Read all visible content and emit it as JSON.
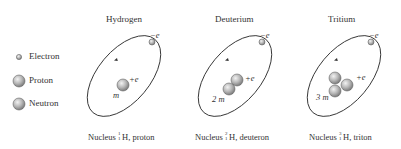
{
  "legend": {
    "items": [
      {
        "label": "Electron",
        "icon": "electron-icon"
      },
      {
        "label": "Proton",
        "icon": "proton-icon"
      },
      {
        "label": "Neutron",
        "icon": "neutron-icon"
      }
    ]
  },
  "atoms": [
    {
      "title": "Hydrogen",
      "electron_charge": "−e",
      "nucleus_charge": "+e",
      "mass_label": "m",
      "caption_prefix": "Nucleus",
      "mass_number": "1",
      "atomic_number": "1",
      "symbol": "H",
      "caption_suffix": ", proton"
    },
    {
      "title": "Deuterium",
      "electron_charge": "−e",
      "nucleus_charge": "+e",
      "mass_label": "2 m",
      "caption_prefix": "Nucleus",
      "mass_number": "2",
      "atomic_number": "1",
      "symbol": "H",
      "caption_suffix": ", deuteron"
    },
    {
      "title": "Tritium",
      "electron_charge": "−e",
      "nucleus_charge": "+e",
      "mass_label": "3 m",
      "caption_prefix": "Nucleus",
      "mass_number": "3",
      "atomic_number": "1",
      "symbol": "H",
      "caption_suffix": ", triton"
    }
  ],
  "colors": {
    "orbit": "#333333",
    "particle_fill": "#b5b5b5",
    "particle_stroke": "#666666",
    "text": "#333333"
  }
}
